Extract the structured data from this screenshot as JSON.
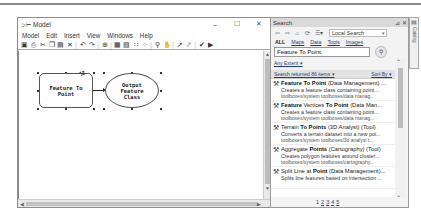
{
  "model_window": {
    "title": "Model",
    "title_icon": "model-icon",
    "window_controls": {
      "minimize": "–",
      "maximize": "☐",
      "close": "✕"
    },
    "menu": [
      "Model",
      "Edit",
      "Insert",
      "View",
      "Windows",
      "Help"
    ],
    "toolbar_icons": [
      "save-icon",
      "print-icon",
      "cut-icon",
      "copy-icon",
      "paste-icon",
      "delete-icon",
      "undo-icon",
      "redo-icon",
      "add-data-icon",
      "auto-layout-icon",
      "full-extent-icon",
      "grid-icon",
      "select-all-icon",
      "zoom-in-icon",
      "pan-icon",
      "select-icon",
      "connect-icon",
      "validate-icon",
      "run-icon"
    ],
    "toolbar_glyphs": [
      "▣",
      "⎙",
      "✂",
      "❐",
      "▤",
      "✕",
      "|",
      "↶",
      "↷",
      "|",
      "⊕",
      "|",
      "▦",
      "▧",
      "∷",
      "⁘",
      "|",
      "⚲",
      "✋",
      "|",
      "➚",
      "⤤",
      "|",
      "✔",
      "▶"
    ],
    "diagram": {
      "tool_node": {
        "line1": "Feature To",
        "line2": "Point"
      },
      "output_node": {
        "line1": "Output",
        "line2": "Feature",
        "line3": "Class"
      }
    },
    "scroll": {
      "up": "▲",
      "down": "▼",
      "left": "◀",
      "right": "▶"
    }
  },
  "search_panel": {
    "title": "Search",
    "title_buttons": {
      "pin": "⊿",
      "close": "✕"
    },
    "nav": {
      "back": "⇦",
      "forward": "⇨",
      "home": "⌂",
      "refresh": "⟳",
      "options": "☰▾"
    },
    "scope": "Local Search",
    "tabs": [
      "ALL",
      "Maps",
      "Data",
      "Tools",
      "Images"
    ],
    "query": "Feature To Point",
    "search_button": "⚲",
    "extent_link": "Any Extent ▾",
    "results_header": "Search returned 86 items ▾",
    "sort_by": "Sort By ▾",
    "results": [
      {
        "title_bold": "Feature To Point",
        "title_rest": " (Data Management) ...",
        "desc": "Creates a feature class containing point...",
        "path": "toolboxes/system toolboxes/data manag..."
      },
      {
        "title_bold": "Feature",
        "title_mid": " Vertices ",
        "title_bold2": "To Point",
        "title_rest": " (Data Man...",
        "desc": "Creates a feature class containing point...",
        "path": "toolboxes/system toolboxes/data manag..."
      },
      {
        "title_bold": "",
        "title_mid": "Terrain ",
        "title_bold2": "To Points",
        "title_rest": " (3D Analyst) (Tool)",
        "desc": "Converts a terrain dataset into a new poi...",
        "path": "toolboxes/system toolboxes/3d analyst t..."
      },
      {
        "title_bold": "",
        "title_mid": "Aggregate ",
        "title_bold2": "Points",
        "title_rest": " (Cartography) (Tool)",
        "desc": "Creates polygon features around cluster...",
        "path": "toolboxes/system toolboxes/cartography..."
      },
      {
        "title_bold": "",
        "title_mid": "Split Line at ",
        "title_bold2": "Point",
        "title_rest": " (Data Management)...",
        "desc": "Splits line features based on intersection ...",
        "path": ""
      }
    ],
    "pages": [
      "1",
      "2",
      "3",
      "4",
      "5"
    ],
    "current_page": "1"
  },
  "catalog_strip": {
    "label": "Catalog",
    "icon": "catalog-icon"
  }
}
